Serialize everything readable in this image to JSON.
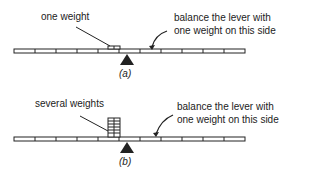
{
  "panel_a": {
    "label_left": "one weight",
    "label_right_line1": "balance the lever with",
    "label_right_line2": "one weight on this side",
    "caption": "(a)"
  },
  "panel_b": {
    "label_left": "several weights",
    "label_right_line1": "balance the lever with",
    "label_right_line2": "one weight on this side",
    "caption": "(b)"
  },
  "colors": {
    "ink": "#222222",
    "background": "#ffffff"
  }
}
